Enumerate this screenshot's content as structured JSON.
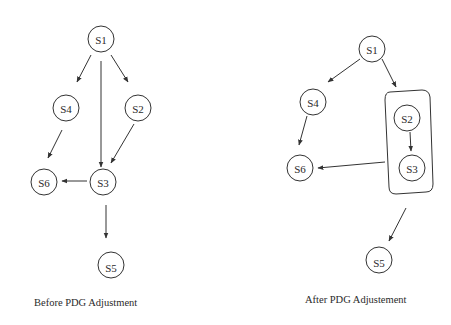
{
  "diagrams": [
    {
      "caption": "Before PDG Adjustment",
      "nodes": [
        {
          "id": "S1",
          "label": "S1"
        },
        {
          "id": "S4",
          "label": "S4"
        },
        {
          "id": "S2",
          "label": "S2"
        },
        {
          "id": "S6",
          "label": "S6"
        },
        {
          "id": "S3",
          "label": "S3"
        },
        {
          "id": "S5",
          "label": "S5"
        }
      ],
      "edges": [
        {
          "from": "S1",
          "to": "S4"
        },
        {
          "from": "S1",
          "to": "S3"
        },
        {
          "from": "S1",
          "to": "S2"
        },
        {
          "from": "S4",
          "to": "S6"
        },
        {
          "from": "S2",
          "to": "S3"
        },
        {
          "from": "S3",
          "to": "S6"
        },
        {
          "from": "S3",
          "to": "S5"
        }
      ]
    },
    {
      "caption": "After PDG Adjustement",
      "nodes": [
        {
          "id": "S1",
          "label": "S1"
        },
        {
          "id": "S4",
          "label": "S4"
        },
        {
          "id": "S2",
          "label": "S2"
        },
        {
          "id": "S3",
          "label": "S3"
        },
        {
          "id": "S6",
          "label": "S6"
        },
        {
          "id": "S5",
          "label": "S5"
        }
      ],
      "groups": [
        {
          "members": [
            "S2",
            "S3"
          ]
        }
      ],
      "edges": [
        {
          "from": "S1",
          "to": "S4"
        },
        {
          "from": "S1",
          "to": "S2S3-group"
        },
        {
          "from": "S4",
          "to": "S6"
        },
        {
          "from": "S2",
          "to": "S3"
        },
        {
          "from": "S2S3-group",
          "to": "S6"
        },
        {
          "from": "S2S3-group",
          "to": "S5"
        }
      ]
    }
  ]
}
